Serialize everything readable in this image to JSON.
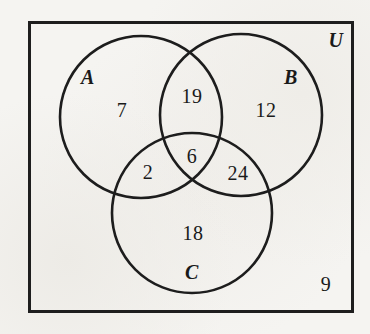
{
  "venn": {
    "type": "three-set-venn-diagram",
    "universal_label": "U",
    "set_labels": {
      "a": "A",
      "b": "B",
      "c": "C"
    },
    "region_values": {
      "a_only": "7",
      "ab_only": "19",
      "b_only": "12",
      "abc": "6",
      "ac_only": "2",
      "bc_only": "24",
      "c_only": "18",
      "outside": "9"
    },
    "colors": {
      "line": "#1e1e1e",
      "paper": "#f5f4f1",
      "text": "#1a1a1a"
    }
  }
}
